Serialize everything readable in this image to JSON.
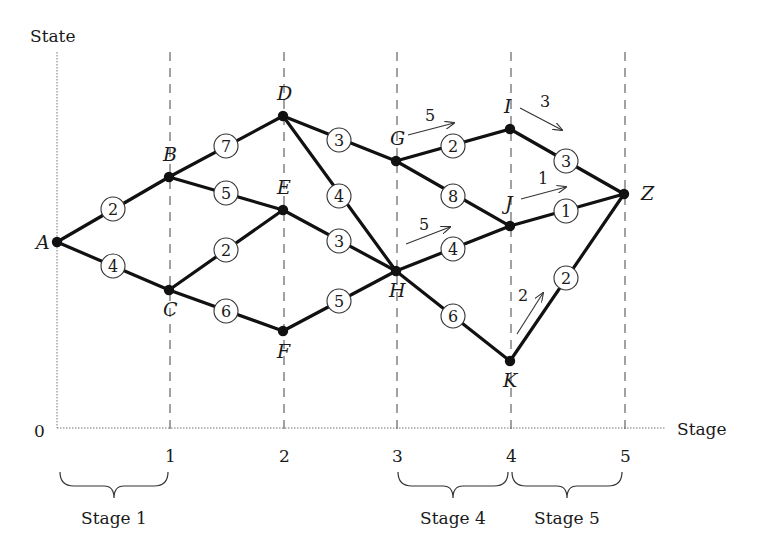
{
  "axes": {
    "y_label": "State",
    "x_label": "Stage",
    "origin_label": "0",
    "ticks": [
      {
        "label": "1",
        "x": 170
      },
      {
        "label": "2",
        "x": 284
      },
      {
        "label": "3",
        "x": 397
      },
      {
        "label": "4",
        "x": 511
      },
      {
        "label": "5",
        "x": 625
      }
    ]
  },
  "nodes": [
    {
      "id": "A",
      "x": 57,
      "y": 242,
      "lx": 36,
      "ly": 249
    },
    {
      "id": "B",
      "x": 169,
      "y": 177,
      "lx": 163,
      "ly": 161
    },
    {
      "id": "C",
      "x": 169,
      "y": 290,
      "lx": 163,
      "ly": 316
    },
    {
      "id": "D",
      "x": 283,
      "y": 116,
      "lx": 277,
      "ly": 100
    },
    {
      "id": "E",
      "x": 283,
      "y": 210,
      "lx": 277,
      "ly": 194
    },
    {
      "id": "F",
      "x": 283,
      "y": 331,
      "lx": 277,
      "ly": 358
    },
    {
      "id": "G",
      "x": 396,
      "y": 161,
      "lx": 390,
      "ly": 145
    },
    {
      "id": "H",
      "x": 396,
      "y": 271,
      "lx": 389,
      "ly": 297
    },
    {
      "id": "I",
      "x": 510,
      "y": 129,
      "lx": 504,
      "ly": 113
    },
    {
      "id": "J",
      "x": 510,
      "y": 226,
      "lx": 505,
      "ly": 210
    },
    {
      "id": "K",
      "x": 510,
      "y": 361,
      "lx": 503,
      "ly": 387
    },
    {
      "id": "Z",
      "x": 624,
      "y": 194,
      "lx": 641,
      "ly": 200
    }
  ],
  "edges": [
    {
      "from": "A",
      "to": "B",
      "weight": "2",
      "wx": 113,
      "wy": 209
    },
    {
      "from": "A",
      "to": "C",
      "weight": "4",
      "wx": 113,
      "wy": 266
    },
    {
      "from": "B",
      "to": "D",
      "weight": "7",
      "wx": 226,
      "wy": 146
    },
    {
      "from": "B",
      "to": "E",
      "weight": "5",
      "wx": 226,
      "wy": 193
    },
    {
      "from": "C",
      "to": "E",
      "weight": "2",
      "wx": 226,
      "wy": 250
    },
    {
      "from": "C",
      "to": "F",
      "weight": "6",
      "wx": 226,
      "wy": 311
    },
    {
      "from": "D",
      "to": "G",
      "weight": "3",
      "wx": 339,
      "wy": 140
    },
    {
      "from": "D",
      "to": "H",
      "weight": "4",
      "wx": 339,
      "wy": 196
    },
    {
      "from": "E",
      "to": "H",
      "weight": "3",
      "wx": 339,
      "wy": 241
    },
    {
      "from": "F",
      "to": "H",
      "weight": "5",
      "wx": 339,
      "wy": 301
    },
    {
      "from": "G",
      "to": "I",
      "weight": "2",
      "wx": 453,
      "wy": 146
    },
    {
      "from": "G",
      "to": "J",
      "weight": "8",
      "wx": 453,
      "wy": 196
    },
    {
      "from": "H",
      "to": "J",
      "weight": "4",
      "wx": 453,
      "wy": 249
    },
    {
      "from": "H",
      "to": "K",
      "weight": "6",
      "wx": 453,
      "wy": 316
    },
    {
      "from": "I",
      "to": "Z",
      "weight": "3",
      "wx": 566,
      "wy": 161
    },
    {
      "from": "J",
      "to": "Z",
      "weight": "1",
      "wx": 566,
      "wy": 211
    },
    {
      "from": "K",
      "to": "Z",
      "weight": "2",
      "wx": 566,
      "wy": 278
    }
  ],
  "optimal_annotations": [
    {
      "value": "5",
      "tx": 425,
      "ty": 121,
      "x1": 408,
      "y1": 135,
      "x2": 454,
      "y2": 123
    },
    {
      "value": "5",
      "tx": 419,
      "ty": 230,
      "x1": 406,
      "y1": 244,
      "x2": 450,
      "y2": 227
    },
    {
      "value": "3",
      "tx": 540,
      "ty": 107,
      "x1": 520,
      "y1": 108,
      "x2": 562,
      "y2": 130
    },
    {
      "value": "1",
      "tx": 538,
      "ty": 184,
      "x1": 521,
      "y1": 199,
      "x2": 566,
      "y2": 187
    },
    {
      "value": "2",
      "tx": 518,
      "ty": 301,
      "x1": 517,
      "y1": 334,
      "x2": 543,
      "y2": 293
    }
  ],
  "stage_braces": [
    {
      "label": "Stage 1",
      "x1": 60,
      "x2": 168,
      "lx": 114
    },
    {
      "label": "Stage 4",
      "x1": 398,
      "x2": 508,
      "lx": 453
    },
    {
      "label": "Stage 5",
      "x1": 512,
      "x2": 622,
      "lx": 567
    }
  ]
}
